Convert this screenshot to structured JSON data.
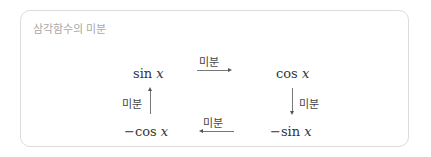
{
  "title": "삼각함수의 미분",
  "nodes": {
    "top_left": {
      "func": "sin",
      "var": "x"
    },
    "top_right": {
      "func": "cos",
      "var": "x"
    },
    "bottom_right": {
      "func": "−sin",
      "var": "x"
    },
    "bottom_left": {
      "func": "−cos",
      "var": "x"
    }
  },
  "arrows": {
    "top": "미분",
    "right": "미분",
    "bottom": "미분",
    "left": "미분"
  }
}
